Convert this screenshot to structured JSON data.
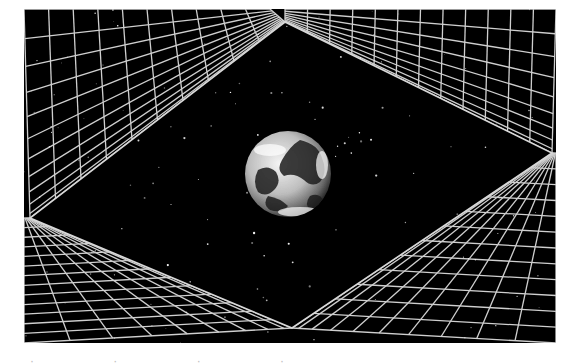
{
  "image": {
    "description": "Earth floating in starry space, framed by a diamond-shaped opening surrounded by four perspective wireframe grid walls",
    "frame": {
      "x": 24,
      "y": 9,
      "width": 532,
      "height": 334
    },
    "background_color": "#000000",
    "border_color": "#ffffff",
    "grid_color": "#cfcfcf",
    "diamond": {
      "top": [
        285,
        22
      ],
      "right": [
        552,
        153
      ],
      "bottom": [
        292,
        328
      ],
      "left": [
        30,
        218
      ]
    },
    "earth": {
      "cx": 288,
      "cy": 174,
      "r": 43
    },
    "walls": [
      {
        "name": "top-left-wall",
        "outer": [
          [
            24,
            9
          ],
          [
            270,
            9
          ]
        ],
        "inner": [
          [
            30,
            218
          ],
          [
            285,
            22
          ]
        ],
        "u": 10,
        "v": 11
      },
      {
        "name": "top-right-wall",
        "outer": [
          [
            285,
            9
          ],
          [
            556,
            9
          ]
        ],
        "inner": [
          [
            285,
            22
          ],
          [
            552,
            153
          ]
        ],
        "u": 12,
        "v": 9
      },
      {
        "name": "bottom-right-wall",
        "outer": [
          [
            556,
            153
          ],
          [
            556,
            343
          ]
        ],
        "inner": [
          [
            552,
            153
          ],
          [
            292,
            328
          ]
        ],
        "u": 12,
        "v": 10
      },
      {
        "name": "bottom-left-wall",
        "outer": [
          [
            24,
            218
          ],
          [
            24,
            343
          ]
        ],
        "inner": [
          [
            30,
            218
          ],
          [
            292,
            328
          ]
        ],
        "u": 13,
        "v": 9
      }
    ],
    "caption_partial": "· · · ·"
  }
}
